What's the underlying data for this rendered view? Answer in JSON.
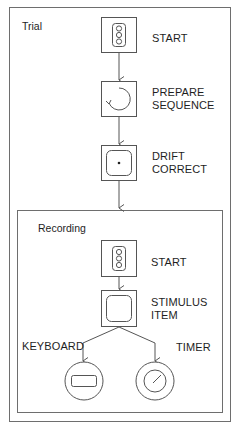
{
  "diagram": {
    "outer_block": {
      "title": "Trial"
    },
    "inner_block": {
      "title": "Recording"
    },
    "trial_nodes": [
      {
        "id": "start",
        "label_lines": [
          "START"
        ],
        "icon": "traffic-light-icon"
      },
      {
        "id": "prepare_sequence",
        "label_lines": [
          "PREPARE",
          "SEQUENCE"
        ],
        "icon": "circular-arrow-icon"
      },
      {
        "id": "drift_correct",
        "label_lines": [
          "DRIFT",
          "CORRECT"
        ],
        "icon": "fixation-dot-icon"
      }
    ],
    "recording_nodes": [
      {
        "id": "start",
        "label_lines": [
          "START"
        ],
        "icon": "traffic-light-icon"
      },
      {
        "id": "stimulus_item",
        "label_lines": [
          "STIMULUS",
          "ITEM"
        ],
        "icon": "display-screen-icon"
      }
    ],
    "triggers": [
      {
        "id": "keyboard",
        "label": "KEYBOARD",
        "icon": "keyboard-key-icon"
      },
      {
        "id": "timer",
        "label": "TIMER",
        "icon": "timer-dial-icon"
      }
    ],
    "line_color": "#555555"
  }
}
